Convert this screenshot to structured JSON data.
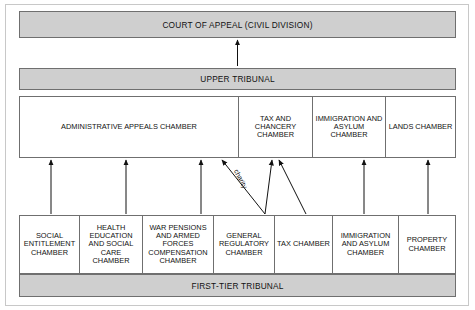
{
  "diagram": {
    "colors": {
      "band_fill": "#cfcfcf",
      "box_fill": "#ffffff",
      "stroke": "#6f6f6f",
      "text": "#121212",
      "frame": "#c8c8c8"
    }
  },
  "top": {
    "label": "COURT OF APPEAL (CIVIL DIVISION)"
  },
  "upper_tribunal": {
    "band_label": "UPPER TRIBUNAL",
    "chambers": [
      {
        "label": "ADMINISTRATIVE APPEALS CHAMBER"
      },
      {
        "label": "TAX AND CHANCERY CHAMBER"
      },
      {
        "label": "IMMIGRATION AND ASYLUM CHAMBER"
      },
      {
        "label": "LANDS CHAMBER"
      }
    ]
  },
  "first_tier": {
    "band_label": "FIRST-TIER TRIBUNAL",
    "chambers": [
      {
        "label": "SOCIAL ENTITLEMENT CHAMBER"
      },
      {
        "label": "HEALTH EDUCATION AND SOCIAL CARE CHAMBER"
      },
      {
        "label": "WAR PENSIONS AND ARMED FORCES COMPENSATION CHAMBER"
      },
      {
        "label": "GENERAL REGULATORY CHAMBER"
      },
      {
        "label": "TAX CHAMBER"
      },
      {
        "label": "IMMIGRATION AND ASYLUM CHAMBER"
      },
      {
        "label": "PROPERTY CHAMBER"
      }
    ]
  },
  "annotations": {
    "charity_route": "charity"
  }
}
